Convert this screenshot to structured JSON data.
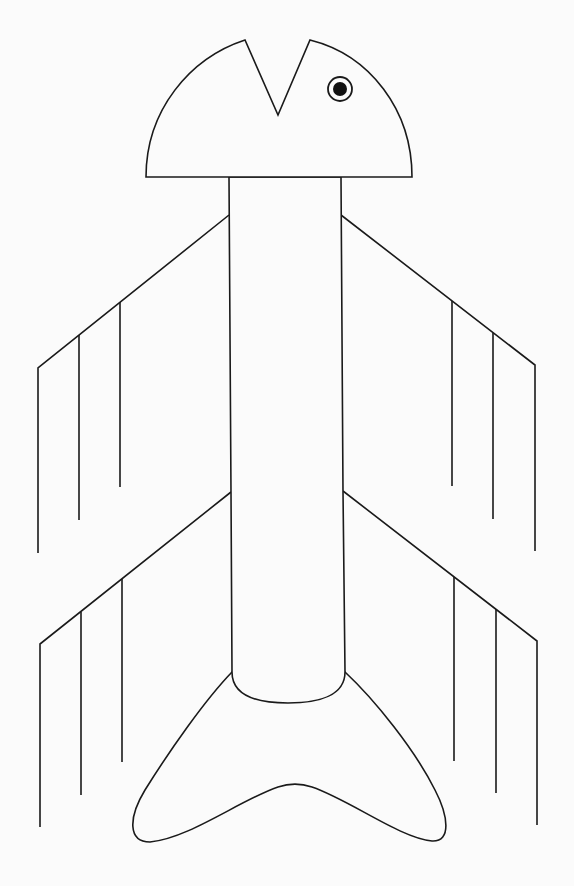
{
  "figure": {
    "colors": {
      "background": "#fbfbfb",
      "line": "#1a1a1a",
      "pupil": "#111111"
    },
    "parts": {
      "head": {
        "shape": "semicircle with V-notch",
        "base_y": 177,
        "left_x": 146,
        "right_x": 412,
        "notch": {
          "left_tip": [
            245,
            40
          ],
          "bottom": [
            278,
            115
          ],
          "right_tip": [
            310,
            40
          ]
        }
      },
      "eye": {
        "cx": 340,
        "cy": 89,
        "ring_r": 12,
        "pupil_r": 7
      },
      "body": {
        "top_y": 177,
        "bottom_y": 672,
        "left_x": 230,
        "right_x": 343,
        "bottom_arc_y": 703
      },
      "wings": [
        {
          "name": "upper-left",
          "root": [
            229,
            215
          ],
          "tip": [
            38,
            368
          ],
          "fringes": [
            [
              38,
              368,
              553
            ],
            [
              79,
              335,
              520
            ],
            [
              120,
              302,
              487
            ]
          ]
        },
        {
          "name": "upper-right",
          "root": [
            341,
            215
          ],
          "tip": [
            535,
            365
          ],
          "fringes": [
            [
              452,
              301,
              486
            ],
            [
              493,
              333,
              519
            ],
            [
              535,
              365,
              551
            ]
          ]
        },
        {
          "name": "lower-left",
          "root": [
            231,
            492
          ],
          "tip": [
            40,
            644
          ],
          "fringes": [
            [
              40,
              644,
              827
            ],
            [
              81,
              612,
              795
            ],
            [
              122,
              579,
              762
            ]
          ]
        },
        {
          "name": "lower-right",
          "root": [
            343,
            491
          ],
          "tip": [
            537,
            641
          ],
          "fringes": [
            [
              454,
              577,
              761
            ],
            [
              496,
              609,
              793
            ],
            [
              537,
              641,
              825
            ]
          ]
        }
      ],
      "tail": {
        "shape": "forked crescent",
        "left_tip": [
          140,
          842
        ],
        "right_tip": [
          440,
          840
        ],
        "inner_peak": [
          290,
          787
        ]
      }
    }
  }
}
